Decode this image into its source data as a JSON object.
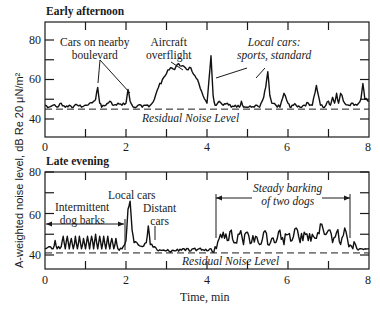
{
  "figure": {
    "ylabel": "A-weighted noise level, dB Re 20 μN/m²",
    "xlabel": "Time, min"
  },
  "panels": [
    {
      "title": "Early afternoon",
      "residual_label": "Residual Noise Level",
      "annotations": [
        {
          "text_1": "Cars on nearby",
          "text_2": "boulevard"
        },
        {
          "text_1": "Aircraft",
          "text_2": "overflight"
        },
        {
          "text_1": "Local cars:",
          "text_2": "sports, standard"
        }
      ]
    },
    {
      "title": "Late evening",
      "residual_label": "Residual Noise Level",
      "annotations": [
        {
          "text_1": "Intermittent",
          "text_2": "dog barks"
        },
        {
          "text_1": "Local cars"
        },
        {
          "text_1": "Distant",
          "text_2": "cars"
        },
        {
          "text_1": "Steady barking",
          "text_2": "of two dogs"
        }
      ]
    }
  ],
  "ticks": {
    "x": [
      "0",
      "2",
      "4",
      "6",
      "8"
    ],
    "y": [
      "80",
      "60",
      "40"
    ]
  },
  "chart_data": [
    {
      "type": "line",
      "title": "Early afternoon",
      "xlabel": "Time, min",
      "ylabel": "A-weighted noise level, dB Re 20 μN/m²",
      "xlim": [
        0,
        8
      ],
      "ylim": [
        30,
        87
      ],
      "xticks": [
        0,
        2,
        4,
        6,
        8
      ],
      "yticks": [
        40,
        60,
        80
      ],
      "reference_line": {
        "label": "Residual Noise Level",
        "y": 45,
        "style": "dashed"
      },
      "x": [
        0,
        0.1,
        0.2,
        0.3,
        0.4,
        0.5,
        0.6,
        0.7,
        0.8,
        0.9,
        1.0,
        1.1,
        1.2,
        1.25,
        1.3,
        1.35,
        1.4,
        1.5,
        1.6,
        1.7,
        1.8,
        1.9,
        2.0,
        2.05,
        2.1,
        2.15,
        2.2,
        2.3,
        2.4,
        2.5,
        2.6,
        2.7,
        2.8,
        2.9,
        3.0,
        3.1,
        3.2,
        3.3,
        3.4,
        3.5,
        3.6,
        3.7,
        3.8,
        3.9,
        4.0,
        4.05,
        4.1,
        4.15,
        4.2,
        4.3,
        4.4,
        4.5,
        4.6,
        4.7,
        4.8,
        4.85,
        4.9,
        5.0,
        5.1,
        5.2,
        5.3,
        5.4,
        5.45,
        5.5,
        5.55,
        5.6,
        5.7,
        5.8,
        5.9,
        6.0,
        6.05,
        6.1,
        6.2,
        6.3,
        6.4,
        6.5,
        6.6,
        6.7,
        6.75,
        6.8,
        6.9,
        7.0,
        7.05,
        7.1,
        7.15,
        7.2,
        7.25,
        7.3,
        7.4,
        7.5,
        7.6,
        7.7,
        7.8,
        7.85,
        7.9,
        8.0
      ],
      "y": [
        47,
        46,
        47,
        46,
        48,
        46,
        47,
        46,
        47,
        46,
        47,
        48,
        49,
        50,
        56,
        48,
        46,
        47,
        49,
        47,
        48,
        47,
        48,
        55,
        49,
        47,
        46,
        47,
        46,
        47,
        47,
        50,
        56,
        60,
        63,
        66,
        65,
        68,
        67,
        65,
        66,
        62,
        58,
        52,
        48,
        60,
        72,
        52,
        47,
        49,
        47,
        48,
        46,
        47,
        46,
        49,
        46,
        46,
        46,
        47,
        46,
        51,
        56,
        64,
        52,
        48,
        47,
        46,
        53,
        48,
        46,
        47,
        47,
        46,
        47,
        48,
        47,
        57,
        52,
        47,
        46,
        49,
        47,
        51,
        48,
        53,
        48,
        53,
        48,
        47,
        48,
        47,
        50,
        58,
        50,
        49
      ],
      "annotations": [
        {
          "text": "Cars on nearby boulevard",
          "points_to_x": [
            1.3,
            2.05
          ]
        },
        {
          "text": "Aircraft overflight",
          "points_to_x": [
            3.4
          ]
        },
        {
          "text": "Local cars: sports, standard",
          "points_to_x": [
            4.1,
            5.5
          ],
          "italic": true
        }
      ]
    },
    {
      "type": "line",
      "title": "Late evening",
      "xlabel": "Time, min",
      "ylabel": "A-weighted noise level, dB Re 20 μN/m²",
      "xlim": [
        0,
        8
      ],
      "ylim": [
        33,
        80
      ],
      "xticks": [
        0,
        2,
        4,
        6,
        8
      ],
      "yticks": [
        40,
        60,
        80
      ],
      "reference_line": {
        "label": "Residual Noise Level",
        "y": 41,
        "style": "dashed"
      },
      "x": [
        0,
        0.1,
        0.2,
        0.25,
        0.3,
        0.4,
        0.45,
        0.5,
        0.55,
        0.6,
        0.65,
        0.7,
        0.75,
        0.8,
        0.85,
        0.9,
        0.95,
        1.0,
        1.05,
        1.1,
        1.15,
        1.2,
        1.25,
        1.3,
        1.35,
        1.4,
        1.45,
        1.5,
        1.55,
        1.6,
        1.65,
        1.7,
        1.75,
        1.8,
        1.9,
        2.0,
        2.05,
        2.1,
        2.15,
        2.2,
        2.3,
        2.4,
        2.5,
        2.55,
        2.6,
        2.7,
        2.8,
        3.0,
        3.2,
        3.4,
        3.6,
        3.8,
        4.0,
        4.1,
        4.2,
        4.3,
        4.4,
        4.5,
        4.6,
        4.7,
        4.8,
        4.9,
        5.0,
        5.1,
        5.2,
        5.3,
        5.4,
        5.5,
        5.6,
        5.7,
        5.8,
        5.9,
        6.0,
        6.1,
        6.2,
        6.3,
        6.4,
        6.5,
        6.6,
        6.7,
        6.8,
        6.9,
        7.0,
        7.1,
        7.2,
        7.3,
        7.4,
        7.5,
        7.6,
        7.7,
        7.8,
        7.9,
        8.0
      ],
      "y": [
        43,
        44,
        43,
        47,
        43,
        44,
        49,
        43,
        49,
        43,
        48,
        43,
        49,
        43,
        49,
        43,
        48,
        43,
        49,
        43,
        49,
        43,
        50,
        43,
        49,
        43,
        49,
        43,
        49,
        43,
        48,
        43,
        48,
        43,
        43,
        47,
        62,
        66,
        52,
        46,
        45,
        44,
        46,
        54,
        45,
        44,
        42,
        42,
        42,
        43,
        42,
        43,
        42,
        43,
        44,
        48,
        51,
        47,
        52,
        46,
        50,
        45,
        51,
        46,
        49,
        45,
        51,
        45,
        48,
        46,
        52,
        45,
        50,
        47,
        53,
        46,
        51,
        47,
        50,
        48,
        55,
        50,
        52,
        46,
        51,
        45,
        53,
        44,
        43,
        43,
        43,
        43,
        43
      ],
      "annotations": [
        {
          "text": "Intermittent dog barks",
          "span_x": [
            0,
            1.95
          ]
        },
        {
          "text": "Local cars",
          "points_to_x": [
            2.1
          ]
        },
        {
          "text": "Distant cars",
          "points_to_x": [
            2.6
          ]
        },
        {
          "text": "Steady barking of two dogs",
          "span_x": [
            4.2,
            7.7
          ],
          "italic": true
        }
      ]
    }
  ]
}
